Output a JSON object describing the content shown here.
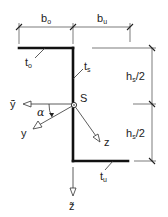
{
  "figure": {
    "type": "cross-section",
    "colors": {
      "line": "#111111",
      "background": "#ffffff"
    }
  },
  "dimensions": {
    "b_o": {
      "main": "b",
      "sub": "o"
    },
    "b_u": {
      "main": "b",
      "sub": "u"
    },
    "h_upper": {
      "main": "h",
      "sub": "s",
      "suffix": "/2"
    },
    "h_lower": {
      "main": "h",
      "sub": "s",
      "suffix": "/2"
    }
  },
  "thicknesses": {
    "t_o": {
      "main": "t",
      "sub": "o"
    },
    "t_s": {
      "main": "t",
      "sub": "s"
    },
    "t_u": {
      "main": "t",
      "sub": "u"
    }
  },
  "centroid": {
    "label": "S"
  },
  "axes": {
    "y_tilde": {
      "label": "ỹ"
    },
    "z_tilde": {
      "label": "z̃"
    },
    "y": {
      "label": "y"
    },
    "z": {
      "label": "z"
    },
    "angle": {
      "label": "α"
    }
  }
}
